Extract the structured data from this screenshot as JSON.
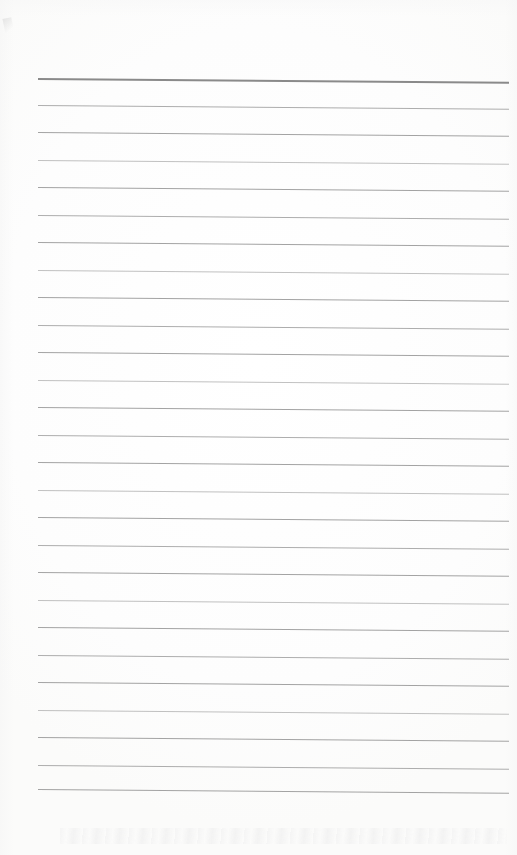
{
  "document": {
    "kind": "scanned-blank-lined-page",
    "title": "Blank ruled notepad page",
    "page_width_px": 517,
    "page_height_px": 855,
    "background_color": "#fdfdfd",
    "text_content": "",
    "has_handwriting": false,
    "has_printed_text": false
  },
  "ruling": {
    "line_count": 27,
    "first_line_y_px": 78,
    "last_line_y_px": 793,
    "line_spacing_px": 27.5,
    "left_margin_px": 38,
    "right_edge_px": 509,
    "line_length_px": 471,
    "skew_degrees": 0.45,
    "header_rule_color": "#8a8a8a",
    "header_rule_thickness_px": 2,
    "body_rule_color": "#9b9b9b",
    "body_rule_thickness_px": 1
  },
  "artifacts": {
    "corner_mark_label": "scanner corner smudge",
    "bottom_smudge_label": "faint grey scan band",
    "edge_shading_label": "scanner edge vignette"
  },
  "lines": [
    {
      "index": 1,
      "y": 78,
      "weight": "header"
    },
    {
      "index": 2,
      "y": 105,
      "weight": "mid"
    },
    {
      "index": 3,
      "y": 132,
      "weight": "body"
    },
    {
      "index": 4,
      "y": 160,
      "weight": "faint"
    },
    {
      "index": 5,
      "y": 187,
      "weight": "body"
    },
    {
      "index": 6,
      "y": 215,
      "weight": "mid"
    },
    {
      "index": 7,
      "y": 242,
      "weight": "body"
    },
    {
      "index": 8,
      "y": 270,
      "weight": "faint"
    },
    {
      "index": 9,
      "y": 297,
      "weight": "body"
    },
    {
      "index": 10,
      "y": 325,
      "weight": "mid"
    },
    {
      "index": 11,
      "y": 352,
      "weight": "body"
    },
    {
      "index": 12,
      "y": 380,
      "weight": "faint"
    },
    {
      "index": 13,
      "y": 407,
      "weight": "body"
    },
    {
      "index": 14,
      "y": 435,
      "weight": "mid"
    },
    {
      "index": 15,
      "y": 462,
      "weight": "body"
    },
    {
      "index": 16,
      "y": 490,
      "weight": "faint"
    },
    {
      "index": 17,
      "y": 517,
      "weight": "body"
    },
    {
      "index": 18,
      "y": 545,
      "weight": "mid"
    },
    {
      "index": 19,
      "y": 572,
      "weight": "body"
    },
    {
      "index": 20,
      "y": 600,
      "weight": "faint"
    },
    {
      "index": 21,
      "y": 627,
      "weight": "body"
    },
    {
      "index": 22,
      "y": 655,
      "weight": "mid"
    },
    {
      "index": 23,
      "y": 682,
      "weight": "body"
    },
    {
      "index": 24,
      "y": 710,
      "weight": "faint"
    },
    {
      "index": 25,
      "y": 737,
      "weight": "body"
    },
    {
      "index": 26,
      "y": 765,
      "weight": "mid"
    },
    {
      "index": 27,
      "y": 789,
      "weight": "body"
    }
  ]
}
